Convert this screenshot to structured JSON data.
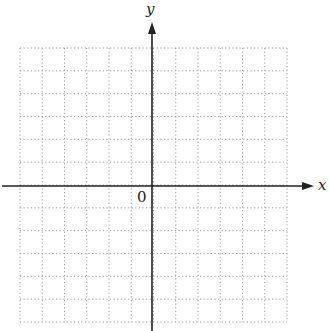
{
  "diagram": {
    "type": "coordinate-plane",
    "grid": {
      "columns": 12,
      "rows": 12,
      "left": 20,
      "top": 48,
      "right": 287,
      "bottom": 322,
      "line_style": "dotted",
      "line_color": "#9a9a9a"
    },
    "axes": {
      "x_label": "x",
      "y_label": "y",
      "origin_label": "0",
      "color": "#222222",
      "x_axis_y": 186,
      "y_axis_x": 152
    }
  }
}
